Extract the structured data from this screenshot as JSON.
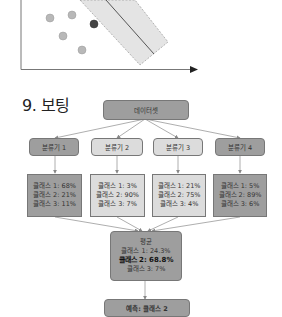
{
  "section_title": "9. 보팅",
  "plot": {
    "description": "SVM margin illustration (partial, cropped at top)",
    "points_light": [
      [
        50,
        18
      ],
      [
        72,
        15
      ],
      [
        63,
        36
      ],
      [
        82,
        50
      ]
    ],
    "point_dark": [
      94,
      24
    ],
    "colors": {
      "light_point": "#b8b8b8",
      "dark_point": "#444444",
      "band": "#e4e4e4",
      "axis": "#777777"
    }
  },
  "diagram": {
    "root": {
      "label": "데이터셋"
    },
    "classifiers": [
      {
        "label": "분류기 1",
        "tone": "dark",
        "results": [
          "클래스 1: 68%",
          "클래스 2: 21%",
          "클래스 3: 11%"
        ]
      },
      {
        "label": "분류기 2",
        "tone": "light",
        "results": [
          "클래스 1: 3%",
          "클래스 2: 90%",
          "클래스 3: 7%"
        ]
      },
      {
        "label": "분류기 3",
        "tone": "light",
        "results": [
          "클래스 1: 21%",
          "클래스 2: 75%",
          "클래스 3: 4%"
        ]
      },
      {
        "label": "분류기 4",
        "tone": "dark",
        "results": [
          "클래스 1: 5%",
          "클래스 2: 89%",
          "클래스 3: 6%"
        ]
      }
    ],
    "average": {
      "title": "평균",
      "lines": [
        "클래스 1: 24.3%",
        "클래스 2: 68.8%",
        "클래스 3: 7%"
      ],
      "bold_index": 1
    },
    "prediction": {
      "label": "예측: 클래스 2"
    },
    "colors": {
      "dark_fill": "#9e9e9e",
      "light_fill": "#dcdcdc",
      "border": "#777777",
      "arrow": "#888888"
    }
  }
}
